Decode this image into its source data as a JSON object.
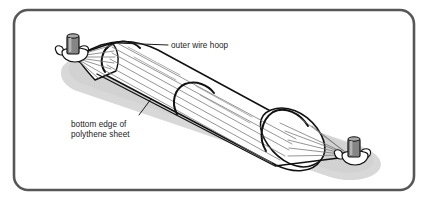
{
  "figure": {
    "border_color": "#575757",
    "background_color": "#ffffff",
    "shadow_color": "#d7d7d7",
    "outline_color": "#111111",
    "hoop_color": "#141414",
    "ridge_color": "#6e6e6e",
    "fitting_color": "#787878",
    "label_color": "#1c1c1c"
  },
  "labels": {
    "hoop": {
      "text": "outer wire hoop",
      "leader_name": "outer-wire-hoop-leader"
    },
    "edge": {
      "line1": "bottom edge of",
      "line2": "polythene sheet",
      "leader_name": "bottom-edge-leader"
    }
  },
  "parts": {
    "tube_body": "polythene sheet tube",
    "left_cone": "left gathered cone",
    "right_dome": "right gathered dome",
    "left_fitting": "left clamp fitting",
    "right_fitting": "right clamp fitting",
    "hoops": [
      "hoop-1",
      "hoop-2",
      "hoop-3"
    ]
  }
}
